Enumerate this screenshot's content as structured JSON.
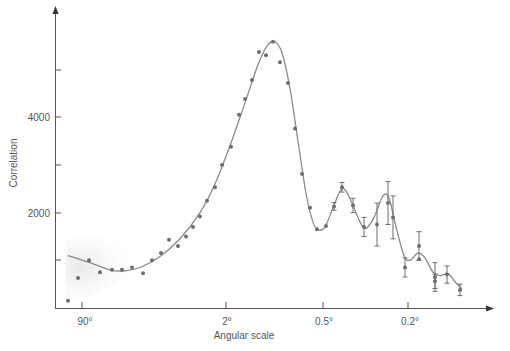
{
  "chart_data": {
    "type": "scatter",
    "title": "",
    "xlabel": "Angular scale",
    "ylabel": "Correlation",
    "x_scale": "log-multipole (angular scale decreasing to the right)",
    "x_ticks": [
      {
        "label": "90°",
        "px": 82
      },
      {
        "label": "2°",
        "px": 226
      },
      {
        "label": "0.5°",
        "px": 323
      },
      {
        "label": "0.2°",
        "px": 408
      }
    ],
    "y_ticks": [
      {
        "label": "",
        "value": 1000
      },
      {
        "label": "2000",
        "value": 2000
      },
      {
        "label": "",
        "value": 3000
      },
      {
        "label": "4000",
        "value": 4000
      },
      {
        "label": "",
        "value": 5000
      }
    ],
    "ylim": [
      0,
      6300
    ],
    "grid": false,
    "legend": null,
    "colors": {
      "curve": "#8a8a8a",
      "points": "#6e6e6e",
      "axis": "#555555",
      "cosmic_variance_band": "#e8e8e8"
    },
    "series": [
      {
        "name": "Measurements",
        "kind": "points_with_error_bars",
        "points": [
          {
            "x": 68,
            "y": 150,
            "err": 0
          },
          {
            "x": 78,
            "y": 630,
            "err": 0
          },
          {
            "x": 89,
            "y": 1000,
            "err": 0
          },
          {
            "x": 100,
            "y": 750,
            "err": 0
          },
          {
            "x": 112,
            "y": 800,
            "err": 0
          },
          {
            "x": 122,
            "y": 800,
            "err": 0
          },
          {
            "x": 132,
            "y": 850,
            "err": 0
          },
          {
            "x": 143,
            "y": 730,
            "err": 0
          },
          {
            "x": 152,
            "y": 1000,
            "err": 0
          },
          {
            "x": 161,
            "y": 1150,
            "err": 0
          },
          {
            "x": 169,
            "y": 1430,
            "err": 0
          },
          {
            "x": 178,
            "y": 1300,
            "err": 0
          },
          {
            "x": 186,
            "y": 1500,
            "err": 0
          },
          {
            "x": 193,
            "y": 1700,
            "err": 0
          },
          {
            "x": 200,
            "y": 1920,
            "err": 0
          },
          {
            "x": 207,
            "y": 2250,
            "err": 0
          },
          {
            "x": 215,
            "y": 2530,
            "err": 0
          },
          {
            "x": 222,
            "y": 3000,
            "err": 0
          },
          {
            "x": 231,
            "y": 3380,
            "err": 0
          },
          {
            "x": 239,
            "y": 4050,
            "err": 0
          },
          {
            "x": 245,
            "y": 4380,
            "err": 0
          },
          {
            "x": 252,
            "y": 4780,
            "err": 0
          },
          {
            "x": 259,
            "y": 5370,
            "err": 0
          },
          {
            "x": 266,
            "y": 5300,
            "err": 0
          },
          {
            "x": 273,
            "y": 5580,
            "err": 0
          },
          {
            "x": 280,
            "y": 5150,
            "err": 0
          },
          {
            "x": 288,
            "y": 4720,
            "err": 0
          },
          {
            "x": 295,
            "y": 3760,
            "err": 0
          },
          {
            "x": 302,
            "y": 2810,
            "err": 0
          },
          {
            "x": 310,
            "y": 2100,
            "err": 0
          },
          {
            "x": 317,
            "y": 1650,
            "err": 0
          },
          {
            "x": 326,
            "y": 1720,
            "err": 0
          },
          {
            "x": 334,
            "y": 2130,
            "err": 80
          },
          {
            "x": 342,
            "y": 2530,
            "err": 100
          },
          {
            "x": 353,
            "y": 2150,
            "err": 150
          },
          {
            "x": 364,
            "y": 1700,
            "err": 200
          },
          {
            "x": 377,
            "y": 1750,
            "err": 450
          },
          {
            "x": 388,
            "y": 2200,
            "err": 450
          },
          {
            "x": 393,
            "y": 1900,
            "err": 450
          },
          {
            "x": 405,
            "y": 850,
            "err": 200
          },
          {
            "x": 419,
            "y": 1300,
            "err": 300
          },
          {
            "x": 419,
            "y": 1020,
            "err": 0
          },
          {
            "x": 435,
            "y": 650,
            "err": 300
          },
          {
            "x": 435,
            "y": 560,
            "err": 150
          },
          {
            "x": 447,
            "y": 700,
            "err": 180
          },
          {
            "x": 460,
            "y": 380,
            "err": 120
          }
        ]
      },
      {
        "name": "Model fit",
        "kind": "curve",
        "points": [
          {
            "x": 68,
            "y": 1100
          },
          {
            "x": 90,
            "y": 950
          },
          {
            "x": 110,
            "y": 800
          },
          {
            "x": 125,
            "y": 780
          },
          {
            "x": 140,
            "y": 850
          },
          {
            "x": 160,
            "y": 1080
          },
          {
            "x": 180,
            "y": 1450
          },
          {
            "x": 200,
            "y": 2000
          },
          {
            "x": 215,
            "y": 2600
          },
          {
            "x": 230,
            "y": 3400
          },
          {
            "x": 245,
            "y": 4300
          },
          {
            "x": 258,
            "y": 5100
          },
          {
            "x": 268,
            "y": 5520
          },
          {
            "x": 275,
            "y": 5580
          },
          {
            "x": 282,
            "y": 5350
          },
          {
            "x": 290,
            "y": 4600
          },
          {
            "x": 298,
            "y": 3500
          },
          {
            "x": 306,
            "y": 2400
          },
          {
            "x": 313,
            "y": 1800
          },
          {
            "x": 318,
            "y": 1640
          },
          {
            "x": 325,
            "y": 1700
          },
          {
            "x": 333,
            "y": 2100
          },
          {
            "x": 340,
            "y": 2450
          },
          {
            "x": 345,
            "y": 2480
          },
          {
            "x": 352,
            "y": 2200
          },
          {
            "x": 360,
            "y": 1800
          },
          {
            "x": 366,
            "y": 1670
          },
          {
            "x": 374,
            "y": 1900
          },
          {
            "x": 383,
            "y": 2350
          },
          {
            "x": 389,
            "y": 2300
          },
          {
            "x": 396,
            "y": 1700
          },
          {
            "x": 404,
            "y": 1100
          },
          {
            "x": 410,
            "y": 1000
          },
          {
            "x": 418,
            "y": 1150
          },
          {
            "x": 425,
            "y": 1050
          },
          {
            "x": 433,
            "y": 750
          },
          {
            "x": 440,
            "y": 680
          },
          {
            "x": 448,
            "y": 720
          },
          {
            "x": 455,
            "y": 550
          },
          {
            "x": 462,
            "y": 400
          }
        ]
      }
    ],
    "annotations": [
      "shaded cosmic-variance band at large angular scales (left)"
    ]
  },
  "labels": {
    "y_axis_title": "Correlation",
    "x_axis_title": "Angular scale",
    "y_tick_4000": "4000",
    "y_tick_2000": "2000",
    "x_tick_90": "90°",
    "x_tick_2": "2°",
    "x_tick_05": "0.5°",
    "x_tick_02": "0.2°"
  }
}
